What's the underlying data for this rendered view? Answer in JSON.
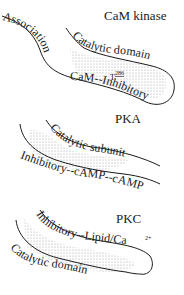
{
  "diagram": {
    "kinases": [
      {
        "name": "CaM kinase",
        "domains": {
          "association": "Association",
          "catalytic": "Catalytic domain",
          "regulatory": "CaM--Inhibitory",
          "site_letter": "T",
          "site_number": "286"
        }
      },
      {
        "name": "PKA",
        "domains": {
          "catalytic": "Catalytic subunit",
          "regulatory": "Inhibitory--cAMP--cAMP"
        }
      },
      {
        "name": "PKC",
        "domains": {
          "regulatory": "Inhibitory--Lipid/Ca",
          "ion_charge": "2+",
          "catalytic": "Catalytic domain"
        }
      }
    ],
    "colors": {
      "ink": "#1a1a1a",
      "stipple": "#9a9a9a",
      "background": "#ffffff"
    }
  }
}
